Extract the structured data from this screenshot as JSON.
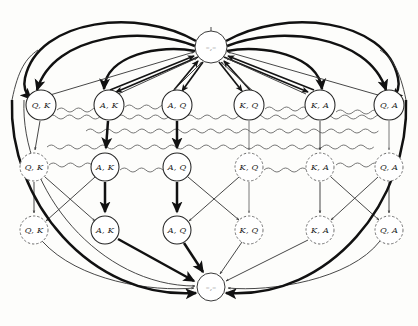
{
  "figure": {
    "background_color": "#fdfdfb",
    "width": 418,
    "height": 326
  },
  "hubs": {
    "top": {
      "label": "–,–",
      "cx": 211,
      "cy": 47,
      "r": 16,
      "style": "solid"
    },
    "bottom": {
      "label": "–,–",
      "cx": 211,
      "cy": 287,
      "r": 14,
      "style": "solid"
    }
  },
  "rows": [
    {
      "name": "row-top",
      "cy": 105,
      "radius": 15,
      "style": "solid",
      "nodes": [
        {
          "label": "Q, K",
          "cx": 41,
          "style": "solid"
        },
        {
          "label": "A, K",
          "cx": 109,
          "style": "solid"
        },
        {
          "label": "A, Q",
          "cx": 177,
          "style": "solid"
        },
        {
          "label": "K, Q",
          "cx": 249,
          "style": "solid"
        },
        {
          "label": "K, A",
          "cx": 320,
          "style": "solid"
        },
        {
          "label": "Q, A",
          "cx": 389,
          "style": "solid"
        }
      ]
    },
    {
      "name": "row-middle",
      "cy": 167,
      "radius": 14,
      "style": "mixed",
      "nodes": [
        {
          "label": "Q, K",
          "cx": 34,
          "style": "dashed"
        },
        {
          "label": "A, K",
          "cx": 105,
          "style": "solid"
        },
        {
          "label": "A, Q",
          "cx": 177,
          "style": "solid"
        },
        {
          "label": "K, Q",
          "cx": 249,
          "style": "dashed"
        },
        {
          "label": "K, A",
          "cx": 320,
          "style": "dashed"
        },
        {
          "label": "Q, A",
          "cx": 389,
          "style": "dashed"
        }
      ]
    },
    {
      "name": "row-bottom",
      "cy": 230,
      "radius": 14,
      "style": "mixed",
      "nodes": [
        {
          "label": "Q, K",
          "cx": 34,
          "style": "dashed"
        },
        {
          "label": "A, K",
          "cx": 105,
          "style": "solid"
        },
        {
          "label": "A, Q",
          "cx": 177,
          "style": "solid"
        },
        {
          "label": "K, Q",
          "cx": 249,
          "style": "dashed"
        },
        {
          "label": "K, A",
          "cx": 320,
          "style": "dashed"
        },
        {
          "label": "Q, A",
          "cx": 389,
          "style": "dashed"
        }
      ]
    }
  ],
  "edge_styles": {
    "thick": "#111111",
    "medium": "#141414",
    "thin": "#3d3d3d",
    "faint": "#6a6a6a",
    "wavy": "#5f5f5f"
  },
  "legend_notes": {
    "solid_circle": "reachable state",
    "dashed_circle": "unreachable / pruned state",
    "wavy_line": "information set link",
    "arrow": "directed transition"
  }
}
